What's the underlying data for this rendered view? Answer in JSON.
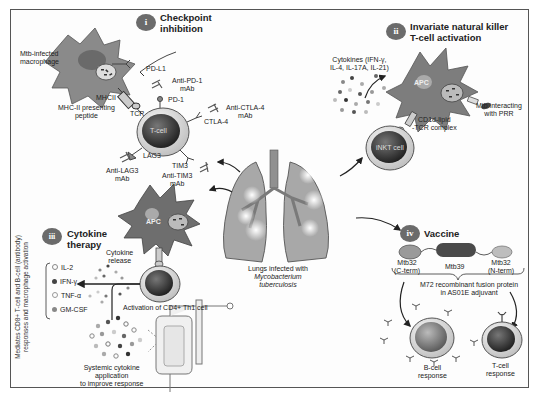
{
  "figure": {
    "center": {
      "label_line1": "Lungs infected with",
      "label_line2": "Mycobacterium",
      "label_line3": "tuberculosis"
    },
    "sections": [
      {
        "numeral": "i",
        "title_line1": "Checkpoint",
        "title_line2": "inhibition",
        "labels": {
          "macrophage_line1": "Mtb-infected",
          "macrophage_line2": "macrophage",
          "pdl1": "PD-L1",
          "anti_pd1_line1": "Anti-PD-1",
          "anti_pd1_line2": "mAb",
          "pd1": "PD-1",
          "mhcii": "MHCII",
          "mhc_peptide_line1": "MHC-II presenting",
          "mhc_peptide_line2": "peptide",
          "tcr": "TCR",
          "tcell": "T-cell",
          "anti_ctla4_line1": "Anti-CTLA-4",
          "anti_ctla4_line2": "mAb",
          "ctla4": "CTLA-4",
          "lag3": "LAG3",
          "tim3": "TIM3",
          "anti_lag3_line1": "Anti-LAG3",
          "anti_lag3_line2": "mAb",
          "anti_tim3_line1": "Anti-TIM3",
          "anti_tim3_line2": "mAb"
        }
      },
      {
        "numeral": "ii",
        "title_line1": "Invariate natural killer",
        "title_line2": "T-cell activation",
        "labels": {
          "cytokines_line1": "Cytokines (IFN-γ,",
          "cytokines_line2": "IL-4, IL-17A, IL-21)",
          "apc": "APC",
          "inkt": "iNKT cell",
          "cd1d_line1": "CD1d-lipid",
          "cd1d_line2": "-TCR complex",
          "prr_line1": "Mtb interacting",
          "prr_line2": "with PRR"
        }
      },
      {
        "numeral": "iii",
        "title_line1": "Cytokine",
        "title_line2": "therapy",
        "labels": {
          "apc": "APC",
          "release_line1": "Cytokine",
          "release_line2": "release",
          "activation": "Activation of CD4+ Th1 cell",
          "systemic_line1": "Systemic cytokine",
          "systemic_line2": "application",
          "systemic_line3": "to improve response",
          "side_note_line1": "Mediates CD8+ T-cell and B-cell (antibody)",
          "side_note_line2": "responses and macrophage activation"
        },
        "cytokine_list": [
          "IL-2",
          "IFN-γ",
          "TNF-α",
          "GM-CSF"
        ]
      },
      {
        "numeral": "iv",
        "title_line1": "Vaccine",
        "labels": {
          "mtb32c_line1": "Mtb32",
          "mtb32c_line2": "(C-term)",
          "mtb39": "Mtb39",
          "mtb32n_line1": "Mtb32",
          "mtb32n_line2": "(N-term)",
          "m72_line1": "M72 recombinant fusion protein",
          "m72_line2": "in AS01E adjuvant",
          "bcell_line1": "B-cell",
          "bcell_line2": "response",
          "tcell_line1": "T-cell",
          "tcell_line2": "response"
        }
      }
    ],
    "colors": {
      "badge": "#6b6b6b",
      "cell_dark": "#2e2e2e",
      "cell_ring": "#e8e8e8",
      "apc": "#7d7d7d",
      "lung": "#a8a8a8"
    }
  }
}
